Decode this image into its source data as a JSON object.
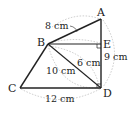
{
  "diagram": {
    "points": {
      "A": {
        "label": "A"
      },
      "B": {
        "label": "B"
      },
      "C": {
        "label": "C"
      },
      "D": {
        "label": "D"
      },
      "E": {
        "label": "E"
      }
    },
    "measurements": {
      "AB": "8 cm",
      "AD": "9 cm",
      "BE_D": "6 cm",
      "BD": "10 cm",
      "CD": "12 cm"
    },
    "colors": {
      "line": "#222222",
      "arc": "#bbbbbb"
    }
  }
}
